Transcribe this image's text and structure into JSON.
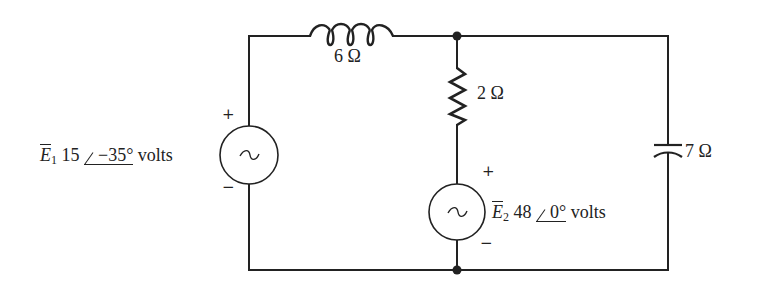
{
  "diagram": {
    "type": "ac-circuit",
    "components": {
      "inductor": {
        "label": "6 Ω"
      },
      "resistor": {
        "label": "2 Ω"
      },
      "capacitor": {
        "label": "7 Ω"
      },
      "source_e1": {
        "name": "E",
        "subscript": "1",
        "magnitude": "15",
        "angle": "−35°",
        "unit": "volts",
        "plus": "+",
        "minus": "−"
      },
      "source_e2": {
        "name": "E",
        "subscript": "2",
        "magnitude": "48",
        "angle": "0°",
        "unit": "volts",
        "plus": "+",
        "minus": "−"
      }
    },
    "colors": {
      "wire": "#222222",
      "background": "#ffffff"
    }
  }
}
